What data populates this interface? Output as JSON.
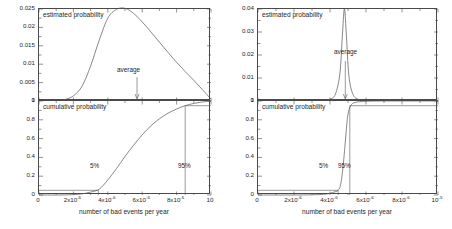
{
  "figure": {
    "xaxis_title": "number of bad events per year",
    "xticklabels": [
      "0",
      "2x10",
      "4x10",
      "6x10",
      "8x10",
      "10"
    ],
    "xtick_exponents": [
      "",
      "-6",
      "-6",
      "-6",
      "-6",
      "-6"
    ],
    "xticks_values": [
      0,
      2,
      4,
      6,
      8,
      10
    ],
    "left_last_label": "10",
    "right_last_label": "10",
    "right_last_exponent": "-5"
  },
  "panels": [
    {
      "id": "left",
      "top": {
        "inlabel": "estimated probability",
        "annotation": "average",
        "ylabels": [
          "0.025",
          "0.02",
          "0.015",
          "0.01",
          "0.005",
          "0"
        ],
        "ytick_values": [
          0.025,
          0.02,
          0.015,
          0.01,
          0.005,
          0
        ]
      },
      "bottom": {
        "inlabel": "cumulative probability",
        "annotation_low": "5%",
        "annotation_high": "95%",
        "ylabels": [
          "1",
          "0.8",
          "0.6",
          "0.4",
          "0.2",
          "0"
        ],
        "ytick_values": [
          1,
          0.8,
          0.6,
          0.4,
          0.2,
          0
        ]
      }
    },
    {
      "id": "right",
      "top": {
        "inlabel": "estimated probability",
        "annotation": "average",
        "ylabels": [
          "0.04",
          "0.03",
          "0.02",
          "0.01",
          "0"
        ],
        "ytick_values": [
          0.04,
          0.03,
          0.02,
          0.01,
          0
        ]
      },
      "bottom": {
        "inlabel": "cumulative probability",
        "annotation_low": "5%",
        "annotation_high": "95%",
        "ylabels": [
          "1",
          "0.8",
          "0.6",
          "0.4",
          "0.2",
          "0"
        ],
        "ytick_values": [
          1,
          0.8,
          0.6,
          0.4,
          0.2,
          0
        ]
      }
    }
  ],
  "chart_data": [
    {
      "type": "line",
      "panel": "left-top",
      "title": "estimated probability",
      "xlabel": "number of bad events per year",
      "ylabel": "",
      "xlim": [
        0,
        1e-05
      ],
      "ylim": [
        0,
        0.025
      ],
      "grid": false,
      "legend": "none",
      "annotations": [
        {
          "text": "average",
          "x": 5.7e-06,
          "y": 0,
          "arrow": "down"
        }
      ],
      "x": [
        0,
        5e-07,
        1e-06,
        1.5e-06,
        2e-06,
        2.5e-06,
        3e-06,
        3.5e-06,
        4e-06,
        4.5e-06,
        5e-06,
        5.5e-06,
        6e-06,
        6.5e-06,
        7e-06,
        7.5e-06,
        8e-06,
        8.5e-06,
        9e-06,
        9.5e-06,
        1e-05
      ],
      "values": [
        0.0,
        0.0,
        0.0001,
        0.0004,
        0.0014,
        0.004,
        0.0095,
        0.0165,
        0.0225,
        0.0249,
        0.0252,
        0.0238,
        0.0215,
        0.0188,
        0.016,
        0.0132,
        0.0105,
        0.008,
        0.0056,
        0.0031,
        0.0005
      ]
    },
    {
      "type": "line",
      "panel": "left-bottom",
      "title": "cumulative probability",
      "xlabel": "number of bad events per year",
      "ylabel": "",
      "xlim": [
        0,
        1e-05
      ],
      "ylim": [
        0,
        1
      ],
      "grid": false,
      "legend": "none",
      "annotations": [
        {
          "text": "5%",
          "x": 3.45e-06,
          "y": 0.05
        },
        {
          "text": "95%",
          "x": 8.5e-06,
          "y": 0.95
        }
      ],
      "x": [
        0,
        5e-07,
        1e-06,
        1.5e-06,
        2e-06,
        2.5e-06,
        3e-06,
        3.5e-06,
        4e-06,
        4.5e-06,
        5e-06,
        5.5e-06,
        6e-06,
        6.5e-06,
        7e-06,
        7.5e-06,
        8e-06,
        8.5e-06,
        9e-06,
        9.5e-06,
        1e-05
      ],
      "values": [
        0.0,
        0.0,
        0.0,
        0.001,
        0.004,
        0.012,
        0.031,
        0.062,
        0.16,
        0.28,
        0.41,
        0.53,
        0.64,
        0.735,
        0.81,
        0.87,
        0.915,
        0.95,
        0.974,
        0.99,
        1.0
      ]
    },
    {
      "type": "line",
      "panel": "right-top",
      "title": "estimated probability",
      "xlabel": "number of bad events per year",
      "ylabel": "",
      "xlim": [
        0,
        1e-05
      ],
      "ylim": [
        0,
        0.04
      ],
      "grid": false,
      "legend": "none",
      "annotations": [
        {
          "text": "average",
          "x": 4.8e-06,
          "y": 0,
          "arrow": "down"
        }
      ],
      "x": [
        0,
        1e-06,
        2e-06,
        3e-06,
        3.6e-06,
        4e-06,
        4.3e-06,
        4.55e-06,
        4.7e-06,
        4.8e-06,
        4.9e-06,
        5.05e-06,
        5.3e-06,
        5.7e-06,
        6.2e-06,
        7e-06,
        8e-06,
        9e-06,
        1e-05
      ],
      "values": [
        0.0,
        0.0,
        0.0,
        0.0,
        0.0002,
        0.0008,
        0.003,
        0.012,
        0.03,
        0.0402,
        0.03,
        0.011,
        0.0025,
        0.0005,
        0.0001,
        0.0,
        0.0,
        0.0,
        0.0
      ]
    },
    {
      "type": "line",
      "panel": "right-bottom",
      "title": "cumulative probability",
      "xlabel": "number of bad events per year",
      "ylabel": "",
      "xlim": [
        0,
        1e-05
      ],
      "ylim": [
        0,
        1
      ],
      "grid": false,
      "legend": "none",
      "annotations": [
        {
          "text": "5%",
          "x": 4.45e-06,
          "y": 0.05
        },
        {
          "text": "95%",
          "x": 5.1e-06,
          "y": 0.95
        }
      ],
      "x": [
        0,
        1e-06,
        2e-06,
        3e-06,
        3.8e-06,
        4.2e-06,
        4.45e-06,
        4.6e-06,
        4.75e-06,
        4.9e-06,
        5e-06,
        5.15e-06,
        5.4e-06,
        6e-06,
        7e-06,
        8e-06,
        9e-06,
        1e-05
      ],
      "values": [
        0.0,
        0.0,
        0.0,
        0.002,
        0.01,
        0.03,
        0.05,
        0.12,
        0.35,
        0.68,
        0.86,
        0.95,
        0.985,
        0.997,
        1.0,
        1.0,
        1.0,
        1.0
      ]
    }
  ]
}
